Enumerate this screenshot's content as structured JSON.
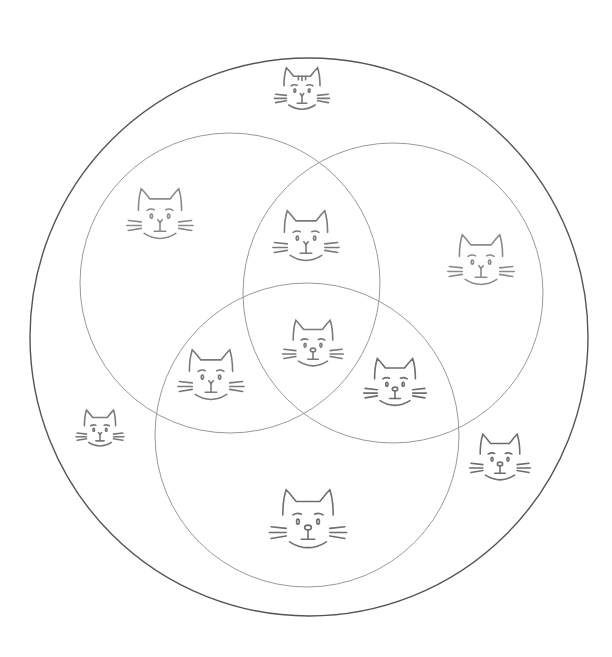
{
  "diagram": {
    "type": "venn-diagram",
    "background": "#ffffff",
    "universe": {
      "cx": 309,
      "cy": 337,
      "r": 279,
      "stroke": "#555555",
      "stroke_width": 1.4
    },
    "sets": [
      {
        "id": "set-a",
        "position": "top-left",
        "cx": 230,
        "cy": 283,
        "r": 150,
        "stroke": "#9a9a9a"
      },
      {
        "id": "set-b",
        "position": "top-right",
        "cx": 393,
        "cy": 293,
        "r": 150,
        "stroke": "#9a9a9a"
      },
      {
        "id": "set-c",
        "position": "bottom",
        "cx": 307,
        "cy": 435,
        "r": 152,
        "stroke": "#9a9a9a"
      }
    ],
    "items": [
      {
        "region": "outside-top",
        "icon": "cat-face-icon",
        "x": 302,
        "y": 93,
        "size": 60,
        "stroke": "#777777",
        "variant": "striped"
      },
      {
        "region": "set-a-only",
        "icon": "cat-face-icon",
        "x": 160,
        "y": 219,
        "size": 72,
        "stroke": "#8a8a8a",
        "variant": "plain"
      },
      {
        "region": "set-a-and-b",
        "icon": "cat-face-icon",
        "x": 306,
        "y": 241,
        "size": 72,
        "stroke": "#7a7a7a",
        "variant": "plain"
      },
      {
        "region": "set-b-only",
        "icon": "cat-face-icon",
        "x": 481,
        "y": 265,
        "size": 72,
        "stroke": "#8a8a8a",
        "variant": "plain"
      },
      {
        "region": "set-a-b-c",
        "icon": "cat-face-icon",
        "x": 313,
        "y": 348,
        "size": 66,
        "stroke": "#7a7a7a",
        "variant": "nose"
      },
      {
        "region": "set-a-and-c",
        "icon": "cat-face-icon",
        "x": 211,
        "y": 380,
        "size": 72,
        "stroke": "#7a7a7a",
        "variant": "plain"
      },
      {
        "region": "set-b-and-c",
        "icon": "cat-face-icon",
        "x": 395,
        "y": 387,
        "size": 68,
        "stroke": "#6e6e6e",
        "variant": "nose"
      },
      {
        "region": "outside-left",
        "icon": "cat-face-icon",
        "x": 100,
        "y": 432,
        "size": 52,
        "stroke": "#7a7a7a",
        "variant": "plain"
      },
      {
        "region": "outside-right",
        "icon": "cat-face-icon",
        "x": 500,
        "y": 462,
        "size": 66,
        "stroke": "#6e6e6e",
        "variant": "nose"
      },
      {
        "region": "set-c-only",
        "icon": "cat-face-icon",
        "x": 308,
        "y": 525,
        "size": 84,
        "stroke": "#6e6e6e",
        "variant": "nose"
      }
    ]
  }
}
